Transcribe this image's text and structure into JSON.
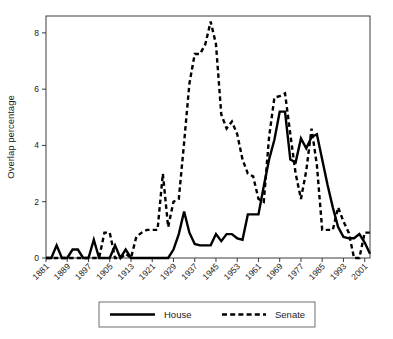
{
  "chart_data": {
    "type": "line",
    "title": "",
    "xlabel": "",
    "ylabel": "Overlap percentage",
    "xlim": [
      1881,
      2003
    ],
    "ylim": [
      0,
      8.6
    ],
    "yticks": [
      0,
      2,
      4,
      6,
      8
    ],
    "ytick_labels": [
      "0",
      "2",
      "4",
      "6",
      "8"
    ],
    "xticks": [
      1881,
      1889,
      1897,
      1905,
      1913,
      1921,
      1929,
      1937,
      1945,
      1953,
      1961,
      1969,
      1977,
      1985,
      1993,
      2001
    ],
    "xtick_labels": [
      "1881",
      "1889",
      "1897",
      "1905",
      "1913",
      "1921",
      "1929",
      "1937",
      "1945",
      "1953",
      "1961",
      "1969",
      "1977",
      "1985",
      "1993",
      "2001"
    ],
    "grid": false,
    "legend_position": "below-axes",
    "legend_entries": [
      {
        "label": "House",
        "style": "solid",
        "color": "#000000"
      },
      {
        "label": "Senate",
        "style": "dashed",
        "color": "#000000"
      }
    ],
    "series": [
      {
        "name": "House",
        "style": "solid",
        "color": "#000000",
        "x": [
          1881,
          1883,
          1885,
          1887,
          1889,
          1891,
          1893,
          1895,
          1897,
          1899,
          1901,
          1903,
          1905,
          1907,
          1909,
          1911,
          1913,
          1915,
          1917,
          1919,
          1921,
          1923,
          1925,
          1927,
          1929,
          1931,
          1933,
          1935,
          1937,
          1939,
          1941,
          1943,
          1945,
          1947,
          1949,
          1951,
          1953,
          1955,
          1957,
          1959,
          1961,
          1963,
          1965,
          1967,
          1969,
          1971,
          1973,
          1975,
          1977,
          1979,
          1981,
          1983,
          1985,
          1987,
          1989,
          1991,
          1993,
          1995,
          1997,
          1999,
          2001,
          2003
        ],
        "values": [
          0.0,
          0.0,
          0.45,
          0.0,
          0.0,
          0.3,
          0.3,
          0.0,
          0.0,
          0.65,
          0.0,
          0.0,
          0.0,
          0.45,
          0.0,
          0.3,
          0.0,
          0.0,
          0.0,
          0.0,
          0.0,
          0.0,
          0.0,
          0.0,
          0.3,
          0.85,
          1.65,
          0.9,
          0.5,
          0.45,
          0.45,
          0.45,
          0.85,
          0.6,
          0.85,
          0.85,
          0.7,
          0.65,
          1.55,
          1.55,
          1.55,
          2.55,
          3.5,
          4.2,
          5.2,
          5.2,
          3.5,
          3.4,
          4.25,
          3.9,
          4.3,
          4.4,
          3.5,
          2.6,
          1.8,
          1.1,
          0.75,
          0.7,
          0.7,
          0.85,
          0.55,
          0.15
        ]
      },
      {
        "name": "Senate",
        "style": "dashed",
        "color": "#000000",
        "x": [
          1881,
          1883,
          1885,
          1887,
          1889,
          1891,
          1893,
          1895,
          1897,
          1899,
          1901,
          1903,
          1905,
          1907,
          1909,
          1911,
          1913,
          1915,
          1917,
          1919,
          1921,
          1923,
          1925,
          1927,
          1929,
          1931,
          1933,
          1935,
          1937,
          1939,
          1941,
          1943,
          1945,
          1947,
          1949,
          1951,
          1953,
          1955,
          1957,
          1959,
          1961,
          1963,
          1965,
          1967,
          1969,
          1971,
          1973,
          1975,
          1977,
          1979,
          1981,
          1983,
          1985,
          1987,
          1989,
          1991,
          1993,
          1995,
          1997,
          1999,
          2001,
          2003
        ],
        "values": [
          0.0,
          0.0,
          0.0,
          0.0,
          0.0,
          0.0,
          0.0,
          0.0,
          0.0,
          0.0,
          0.0,
          0.9,
          0.9,
          0.0,
          0.0,
          0.15,
          0.0,
          0.75,
          0.9,
          1.0,
          1.0,
          1.0,
          3.0,
          1.1,
          2.0,
          2.1,
          4.1,
          6.2,
          7.25,
          7.25,
          7.6,
          8.4,
          7.6,
          5.1,
          4.6,
          4.85,
          4.4,
          3.5,
          3.0,
          2.9,
          2.1,
          2.0,
          4.3,
          5.7,
          5.75,
          5.85,
          4.4,
          3.0,
          2.1,
          3.1,
          4.6,
          3.3,
          1.0,
          1.0,
          1.0,
          1.8,
          1.3,
          0.9,
          0.0,
          0.0,
          0.9,
          0.9
        ]
      }
    ]
  }
}
